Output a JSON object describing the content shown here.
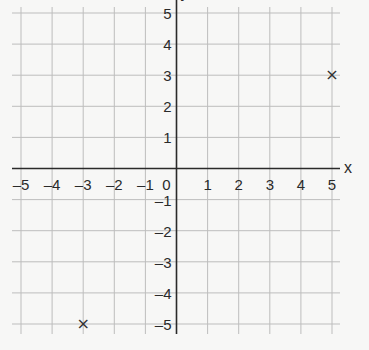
{
  "chart_data": {
    "type": "scatter",
    "title": "",
    "xlabel": "x",
    "ylabel": "y",
    "xlim": [
      -5,
      5
    ],
    "ylim": [
      -5,
      5
    ],
    "grid": true,
    "x_ticks": [
      "-5",
      "-4",
      "-3",
      "-2",
      "-1",
      "0",
      "1",
      "2",
      "3",
      "4",
      "5"
    ],
    "y_ticks": [
      "5",
      "4",
      "3",
      "2",
      "1",
      "-1",
      "-2",
      "-3",
      "-4",
      "-5"
    ],
    "points": [
      {
        "x": 5,
        "y": 3,
        "marker": "×"
      },
      {
        "x": -3,
        "y": -5,
        "marker": "×"
      }
    ],
    "colors": {
      "grid": "#bdbdbd",
      "axis": "#2a2a2a",
      "background": "#f7f7f6"
    }
  }
}
